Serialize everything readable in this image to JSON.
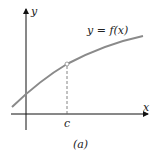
{
  "figure": {
    "axes": {
      "x_label": "x",
      "y_label": "y"
    },
    "curve_label": "y = f(x)",
    "point_label": "c",
    "caption": "(a)",
    "colors": {
      "curve": "#8a8a8a",
      "axis": "#111111",
      "dashed": "#666666"
    }
  }
}
